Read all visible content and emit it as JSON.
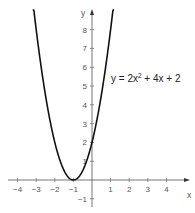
{
  "chart_data": {
    "type": "line",
    "title": "",
    "xlabel": "x",
    "ylabel": "y",
    "xlim": [
      -4.5,
      5.2
    ],
    "ylim": [
      -1.2,
      9
    ],
    "grid": false,
    "x_ticks": [
      -4,
      -3,
      -2,
      -1,
      1,
      2,
      3,
      4
    ],
    "x_tick_labels": [
      "−4",
      "−3",
      "−2",
      "−1",
      "1",
      "2",
      "3",
      "4"
    ],
    "y_ticks": [
      -1,
      1,
      2,
      3,
      4,
      5,
      6,
      7,
      8
    ],
    "y_tick_labels": [
      "−1",
      "1",
      "2",
      "3",
      "4",
      "5",
      "6",
      "7",
      "8"
    ],
    "series": [
      {
        "name": "y = 2x² + 4x + 2",
        "function": "2*x^2 + 4*x + 2",
        "x": [
          -3.19,
          -3,
          -2.5,
          -2,
          -1.5,
          -1,
          -0.5,
          0,
          0.5,
          1,
          1.19
        ],
        "values": [
          9.6,
          8,
          6.5,
          2,
          0.5,
          0,
          0.5,
          2,
          4.5,
          8,
          9.6
        ]
      }
    ],
    "annotations": [
      {
        "text_main": "y = 2x",
        "text_sup": "2",
        "text_rest": " + 4x + 2",
        "x": 1.0,
        "y": 5.2
      }
    ],
    "vertex": {
      "x": -1,
      "y": 0
    },
    "colors": {
      "curve": "#111111",
      "axis": "#555555",
      "tick_text": "#555555"
    }
  }
}
